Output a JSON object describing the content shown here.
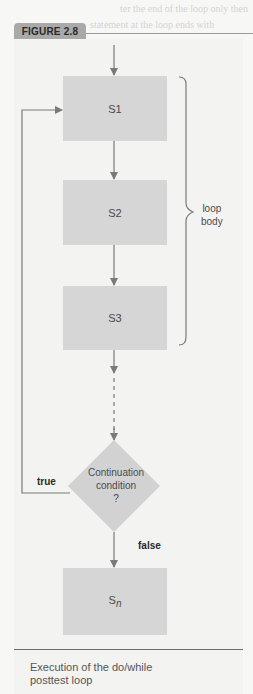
{
  "figure": {
    "tab_label": "FIGURE 2.8",
    "caption_line1": "Execution of the do/while",
    "caption_line2": "posttest loop"
  },
  "flowchart": {
    "boxes": [
      {
        "id": "s1",
        "label": "S1"
      },
      {
        "id": "s2",
        "label": "S2"
      },
      {
        "id": "s3",
        "label": "S3"
      },
      {
        "id": "sn",
        "label": "S",
        "subscript": "n"
      }
    ],
    "decision": {
      "line1": "Continuation",
      "line2": "condition",
      "line3": "?"
    },
    "true_label": "true",
    "false_label": "false",
    "brace_label_line1": "loop",
    "brace_label_line2": "body"
  },
  "colors": {
    "box_fill": "#d6d6d6",
    "line": "#7a7a7a",
    "tab_fill": "#a9a9a9",
    "panel_bg": "#f3f3f2"
  }
}
